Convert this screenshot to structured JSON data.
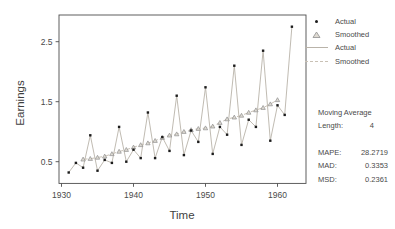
{
  "chart_data": {
    "type": "line",
    "title": "",
    "xlabel": "Time",
    "ylabel": "Earnings",
    "x_ticks": [
      "1930",
      "1940",
      "1950",
      "1960"
    ],
    "y_ticks": [
      "0.5",
      "1.5",
      "2.5"
    ],
    "xlim": [
      1929.7,
      1964.0
    ],
    "ylim": [
      0.14,
      2.94
    ],
    "grid": false,
    "legend_position": "top-right-outside",
    "series": [
      {
        "name": "Actual",
        "style": "solid-line-with-square-points",
        "x": [
          1931,
          1932,
          1933,
          1934,
          1935,
          1936,
          1937,
          1938,
          1939,
          1940,
          1941,
          1942,
          1943,
          1944,
          1945,
          1946,
          1947,
          1948,
          1949,
          1950,
          1951,
          1952,
          1953,
          1954,
          1955,
          1956,
          1957,
          1958,
          1959,
          1960,
          1961,
          1962
        ],
        "values": [
          0.32,
          0.48,
          0.4,
          0.94,
          0.35,
          0.53,
          0.48,
          1.08,
          0.5,
          0.7,
          0.56,
          1.32,
          0.56,
          0.91,
          0.68,
          1.6,
          0.61,
          1.02,
          0.83,
          1.74,
          0.63,
          1.08,
          0.95,
          2.1,
          0.78,
          1.2,
          1.08,
          2.35,
          0.85,
          1.44,
          1.28,
          2.75
        ]
      },
      {
        "name": "Smoothed",
        "style": "dashed-line-with-triangles",
        "x": [
          1933,
          1934,
          1935,
          1936,
          1937,
          1938,
          1939,
          1940,
          1941,
          1942,
          1943,
          1944,
          1945,
          1946,
          1947,
          1948,
          1949,
          1950,
          1951,
          1952,
          1953,
          1954,
          1955,
          1956,
          1957,
          1958,
          1959,
          1960
        ],
        "values": [
          0.54,
          0.55,
          0.57,
          0.59,
          0.63,
          0.67,
          0.7,
          0.74,
          0.78,
          0.81,
          0.85,
          0.9,
          0.94,
          0.96,
          1.0,
          1.03,
          1.05,
          1.06,
          1.09,
          1.15,
          1.21,
          1.24,
          1.27,
          1.32,
          1.36,
          1.4,
          1.46,
          1.53
        ]
      }
    ],
    "legend": [
      {
        "symbol": "point-marker",
        "label": "Actual"
      },
      {
        "symbol": "triangle-marker",
        "label": "Smoothed"
      },
      {
        "symbol": "solid-line-marker",
        "label": "Actual"
      },
      {
        "symbol": "dashed-line-marker",
        "label": "Smoothed"
      }
    ]
  },
  "stats_panel": {
    "title": "Moving Average",
    "length": {
      "label": "Length:",
      "value": "4"
    },
    "rows": [
      {
        "label": "MAPE:",
        "value": "28.2719"
      },
      {
        "label": "MAD:",
        "value": "0.3353"
      },
      {
        "label": "MSD:",
        "value": "0.2361"
      }
    ]
  },
  "colors": {
    "background": "#ffffff",
    "axis": "#4d4d4d",
    "text": "#4a4a4a",
    "actual_point": "#1c1c1c",
    "actual_line": "#b9b3a9",
    "smoothed_line": "#c9c1b5",
    "smoothed_marker_fill": "#dedad2",
    "smoothed_marker_stroke": "#8f8f8f"
  }
}
